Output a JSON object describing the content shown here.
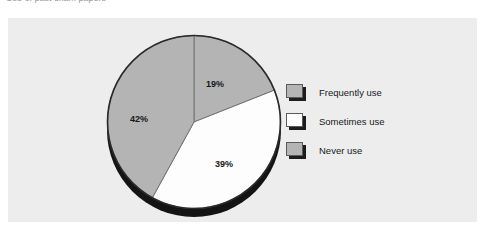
{
  "caption": {
    "text": "Use of past exam papers"
  },
  "chart_data": {
    "type": "pie",
    "title": "",
    "subtitle": "",
    "xlabel": "",
    "ylabel": "",
    "grid": false,
    "legend_position": "right",
    "start_angle_deg": 0,
    "direction": "clockwise",
    "categories": [
      "Frequently use",
      "Sometimes use",
      "Never use"
    ],
    "values": [
      19,
      39,
      42
    ],
    "value_unit": "%",
    "data_labels": [
      "19%",
      "39%",
      "42%"
    ],
    "colors": [
      "#b4b4b4",
      "#fdfdfd",
      "#b4b4b4"
    ],
    "slices": [
      {
        "label": "Frequently use",
        "value": 19,
        "display": "19%",
        "color": "#b4b4b4"
      },
      {
        "label": "Sometimes use",
        "value": 39,
        "display": "39%",
        "color": "#fdfdfd"
      },
      {
        "label": "Never use",
        "value": 42,
        "display": "42%",
        "color": "#b4b4b4"
      }
    ]
  },
  "panel": {
    "background_color": "#ededed"
  },
  "legend": {
    "items": [
      {
        "label": "Frequently use",
        "color": "#b4b4b4"
      },
      {
        "label": "Sometimes use",
        "color": "#fdfdfd"
      },
      {
        "label": "Never use",
        "color": "#b4b4b4"
      }
    ]
  }
}
